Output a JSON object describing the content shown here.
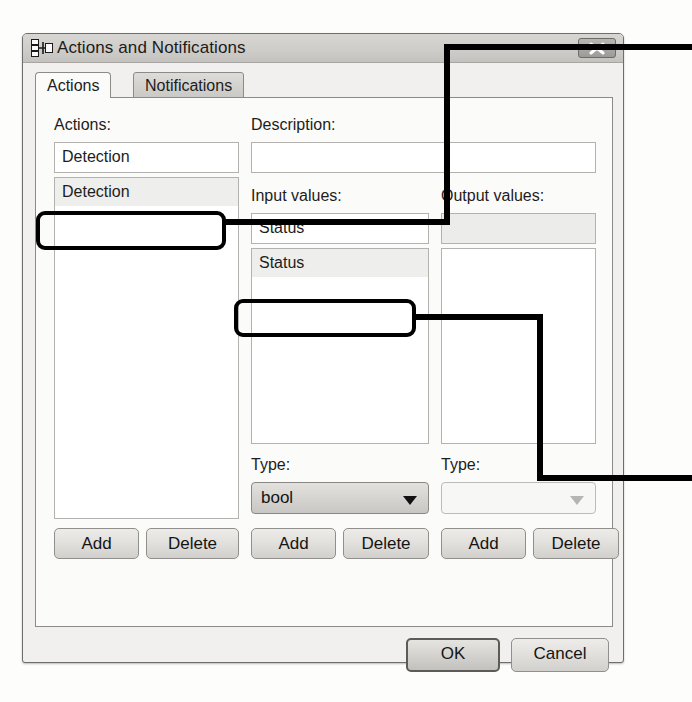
{
  "window": {
    "title": "Actions and Notifications",
    "icon": "hierarchy-icon",
    "close_label": "close-icon"
  },
  "tabs": [
    {
      "label": "Actions",
      "active": true
    },
    {
      "label": "Notifications",
      "active": false
    }
  ],
  "panels": {
    "actions": {
      "label": "Actions:",
      "combo_value": "Detection",
      "list_items": [
        "Detection"
      ],
      "selected_item": "Detection",
      "add_label": "Add",
      "delete_label": "Delete"
    },
    "description": {
      "label": "Description:",
      "value": ""
    },
    "input_values": {
      "label": "Input values:",
      "combo_value": "Status",
      "list_items": [
        "Status"
      ],
      "selected_item": "Status",
      "type_label": "Type:",
      "type_value": "bool",
      "type_enabled": true,
      "add_label": "Add",
      "delete_label": "Delete"
    },
    "output_values": {
      "label": "Output values:",
      "combo_value": "",
      "list_items": [],
      "type_label": "Type:",
      "type_value": "",
      "type_enabled": false,
      "add_label": "Add",
      "delete_label": "Delete"
    }
  },
  "footer": {
    "ok_label": "OK",
    "cancel_label": "Cancel"
  },
  "colors": {
    "annotation": "#000000",
    "titlebar": "#cfcdc9",
    "dialog_bg": "#f1f0ee",
    "page_bg": "#fbfbfa"
  }
}
